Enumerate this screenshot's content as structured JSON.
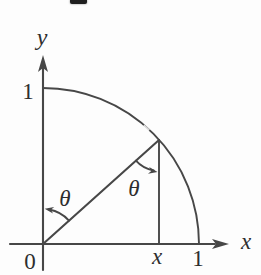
{
  "labels": {
    "y_axis": "y",
    "x_axis": "x",
    "y_tick_one": "1",
    "x_tick_one": "1",
    "origin": "0",
    "x_coordinate": "x",
    "theta_at_origin": "θ",
    "theta_at_point": "θ"
  },
  "colors": {
    "stroke": "#474747",
    "text": "#2e2e2e",
    "background": "#fdfdfd"
  }
}
